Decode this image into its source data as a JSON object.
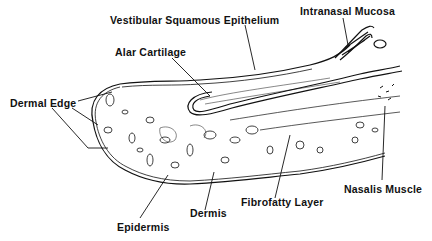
{
  "diagram": {
    "type": "anatomical cross-section",
    "labels": {
      "vestibular_squamous_epithelium": "Vestibular Squamous Epithelium",
      "intranasal_mucosa": "Intranasal Mucosa",
      "alar_cartilage": "Alar Cartilage",
      "dermal_edge": "Dermal Edge",
      "nasalis_muscle": "Nasalis Muscle",
      "fibrofatty_layer": "Fibrofatty Layer",
      "dermis": "Dermis",
      "epidermis": "Epidermis"
    },
    "colors": {
      "ink": "#111111",
      "background": "#ffffff"
    }
  }
}
